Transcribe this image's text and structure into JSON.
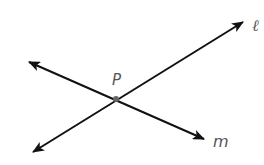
{
  "diagram": {
    "colors": {
      "line": "#111111",
      "point": "#666666",
      "label": "#555555",
      "background": "#ffffff"
    },
    "lines": [
      {
        "name": "ℓ",
        "label": "ℓ",
        "from": [
          33,
          152
        ],
        "to": [
          243,
          22
        ],
        "label_pos": [
          252,
          31
        ]
      },
      {
        "name": "m",
        "label": "m",
        "from": [
          29,
          62
        ],
        "to": [
          204,
          139
        ],
        "label_pos": [
          213,
          147
        ]
      }
    ],
    "points": [
      {
        "name": "P",
        "label": "P",
        "pos": [
          116,
          99
        ],
        "label_pos": [
          112,
          85
        ]
      }
    ]
  }
}
